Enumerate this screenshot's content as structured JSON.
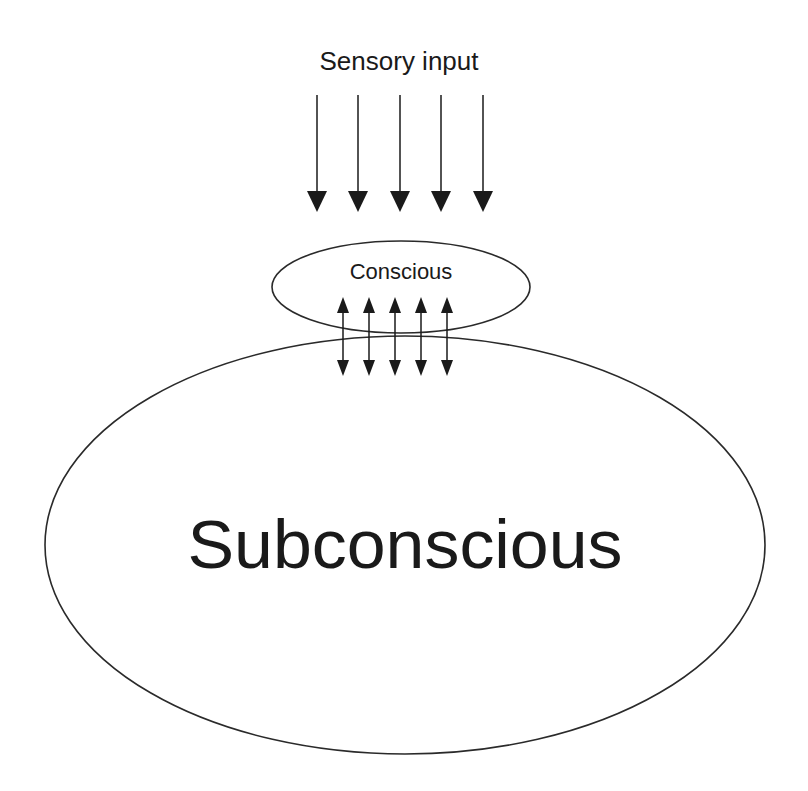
{
  "diagram": {
    "type": "conceptual-model",
    "labels": {
      "input": "Sensory input",
      "conscious": "Conscious",
      "subconscious": "Subconscious"
    },
    "nodes": [
      {
        "id": "conscious",
        "label": "Conscious",
        "shape": "ellipse"
      },
      {
        "id": "subconscious",
        "label": "Subconscious",
        "shape": "ellipse"
      }
    ],
    "edges": [
      {
        "from": "Sensory input",
        "to": "conscious",
        "count": 5,
        "direction": "one-way-down"
      },
      {
        "from": "conscious",
        "to": "subconscious",
        "count": 5,
        "direction": "bidirectional"
      }
    ],
    "colors": {
      "stroke": "#2a2a2a",
      "text": "#1a1a1a",
      "background": "#ffffff"
    }
  }
}
